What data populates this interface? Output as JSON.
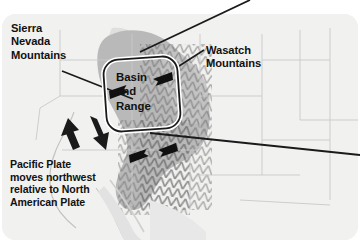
{
  "figure": {
    "type": "annotated-map",
    "region": "Western United States",
    "base_color": "#f0f0ef",
    "highland_color": "#b9b9b9",
    "text_color": "#111111"
  },
  "labels": {
    "sierra_nevada": "Sierra\nNevada\nMountains",
    "wasatch": "Wasatch\nMountains",
    "basin_and_range": "Basin\nand\nRange",
    "pacific_plate": "Pacific Plate\nmoves northwest\nrelative to North\nAmerican Plate"
  },
  "annotations": {
    "callout_box_name": "basin-and-range-callout",
    "leader_sierra": "leader-line-sierra-nevada",
    "leader_wasatch": "leader-line-wasatch",
    "pointer_top_right": "pointer-line-top-right",
    "pointer_mid_right": "pointer-line-mid-right",
    "arrow_nw": "block-arrow-northwest",
    "arrow_se": "block-arrow-southeast",
    "arrow_extension": "double-headed-extension-arrow",
    "arrow_basin_ne": "basin-arrow-northeast",
    "arrow_basin_sw": "basin-arrow-southwest"
  }
}
